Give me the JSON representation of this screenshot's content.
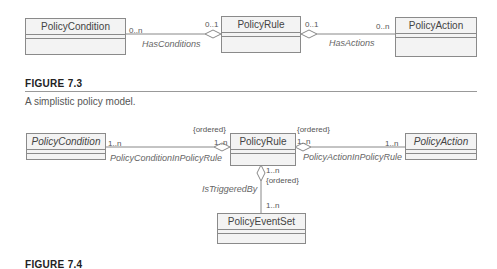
{
  "figure_7_3": {
    "classes": {
      "condition": "PolicyCondition",
      "rule": "PolicyRule",
      "action": "PolicyAction"
    },
    "associations": {
      "has_conditions": {
        "name": "HasConditions",
        "mult_condition": "0..n",
        "mult_rule": "0..1"
      },
      "has_actions": {
        "name": "HasActions",
        "mult_rule": "0..1",
        "mult_action": "0..n"
      }
    },
    "label": "FIGURE 7.3",
    "caption": "A simplistic policy model."
  },
  "figure_7_4": {
    "classes": {
      "condition": "PolicyCondition",
      "rule": "PolicyRule",
      "action": "PolicyAction",
      "event_set": "PolicyEventSet"
    },
    "associations": {
      "condition_in_rule": {
        "name": "PolicyConditionInPolicyRule",
        "mult_condition": "1..n",
        "mult_rule": "1..n",
        "constraint": "{ordered}"
      },
      "action_in_rule": {
        "name": "PolicyActionInPolicyRule",
        "mult_rule": "1..n",
        "mult_action": "1..n",
        "constraint": "{ordered}"
      },
      "is_triggered_by": {
        "name": "IsTriggeredBy",
        "mult_rule": "1..n",
        "mult_event_set": "1..n",
        "constraint": "{ordered}"
      }
    },
    "label": "FIGURE 7.4"
  }
}
